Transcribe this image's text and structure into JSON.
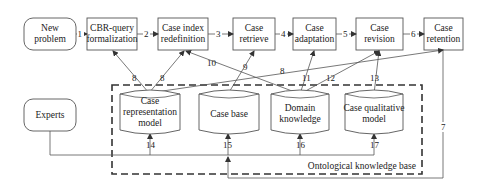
{
  "process_nodes": [
    {
      "id": "new_problem",
      "lines": [
        "New",
        "problem"
      ]
    },
    {
      "id": "cbr_query",
      "lines": [
        "CBR-query",
        "formalization"
      ]
    },
    {
      "id": "case_index",
      "lines": [
        "Case index",
        "redefinition"
      ]
    },
    {
      "id": "case_retrieve",
      "lines": [
        "Case",
        "retrieve"
      ]
    },
    {
      "id": "case_adaptation",
      "lines": [
        "Case",
        "adaptation"
      ]
    },
    {
      "id": "case_revision",
      "lines": [
        "Case",
        "revision"
      ]
    },
    {
      "id": "case_retention",
      "lines": [
        "Case",
        "retention"
      ]
    }
  ],
  "experts": {
    "label": "Experts"
  },
  "knowledge_base": {
    "title": "Ontological knowledge base",
    "stores": [
      {
        "id": "case_rep_model",
        "lines": [
          "Case",
          "representation",
          "model"
        ]
      },
      {
        "id": "case_base",
        "lines": [
          "Case base"
        ]
      },
      {
        "id": "domain_knowledge",
        "lines": [
          "Domain",
          "knowledge"
        ]
      },
      {
        "id": "case_qual_model",
        "lines": [
          "Case qualitative",
          "model"
        ]
      }
    ]
  },
  "edge_labels": {
    "e1": "1",
    "e2": "2",
    "e3": "3",
    "e4": "4",
    "e5": "5",
    "e6": "6",
    "e7": "7",
    "e8a": "8",
    "e8b": "8",
    "e8c": "8",
    "e9": "9",
    "e10": "10",
    "e11": "11",
    "e12": "12",
    "e13": "13",
    "e14": "14",
    "e15": "15",
    "e16": "16",
    "e17": "17"
  }
}
